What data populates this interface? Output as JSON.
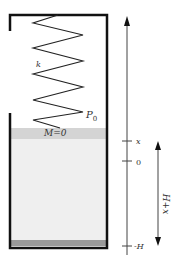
{
  "diagram": {
    "type": "spring-piston-in-container",
    "spring_label": "k",
    "piston_pressure_label": "P",
    "piston_pressure_subscript": "0",
    "piston_mass_label": "M=0",
    "axis": {
      "direction": "up",
      "ticks": [
        {
          "label": "x"
        },
        {
          "label": "0"
        },
        {
          "label": "-H"
        }
      ]
    },
    "span_label": "H+x",
    "colors": {
      "wall": "#111111",
      "spring": "#222222",
      "piston": "#d4d4d4",
      "fluid": "#efefef",
      "bottom": "#9a9a9a",
      "axis": "#444444"
    }
  }
}
